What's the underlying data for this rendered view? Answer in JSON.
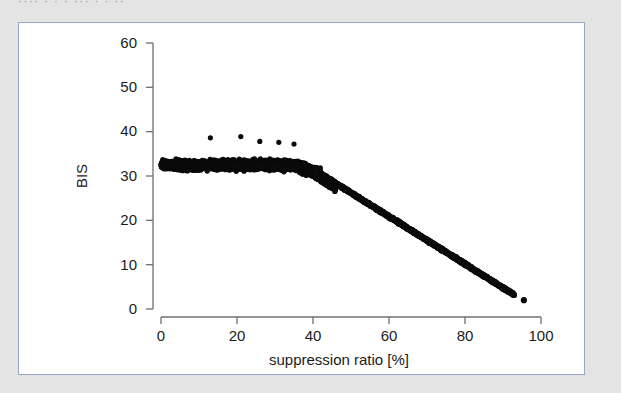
{
  "page": {
    "background_color": "#e4e4e4",
    "clipped_header_text": "···· · · ·  ··· · · ··"
  },
  "figure": {
    "border_color": "#97a7c8",
    "background_color": "#ffffff"
  },
  "chart_data": {
    "type": "scatter",
    "title": "",
    "xlabel": "suppression ratio [%]",
    "ylabel": "BIS",
    "xlim": [
      0,
      100
    ],
    "ylim": [
      0,
      60
    ],
    "xticks": [
      0,
      20,
      40,
      60,
      80,
      100
    ],
    "yticks": [
      0,
      10,
      20,
      30,
      40,
      50,
      60
    ],
    "xticklabels": [
      "0",
      "20",
      "40",
      "60",
      "80",
      "100"
    ],
    "yticklabels": [
      "0",
      "10",
      "20",
      "30",
      "40",
      "50",
      "60"
    ],
    "grid": false,
    "legend": null,
    "marker_color": "#0a0a0a",
    "marker_size": 2.6,
    "series": [
      {
        "name": "BIS vs suppression ratio",
        "plateau": {
          "x_range": [
            0,
            42
          ],
          "y_center": 32.5,
          "y_spread": [
            28,
            37
          ]
        },
        "outliers": [
          {
            "x": 13,
            "y": 38.6
          },
          {
            "x": 21,
            "y": 38.9
          },
          {
            "x": 26,
            "y": 37.8
          },
          {
            "x": 31,
            "y": 37.6
          },
          {
            "x": 35,
            "y": 37.2
          }
        ],
        "descent": {
          "x_range": [
            42,
            93
          ],
          "y_start": 30.5,
          "y_end": 3.2,
          "band_width": 1.1
        },
        "tail_point": {
          "x": 95.5,
          "y": 2.0
        }
      }
    ]
  }
}
